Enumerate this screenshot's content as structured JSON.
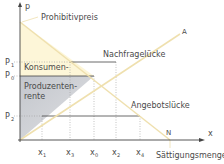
{
  "axes": {
    "y_label": "p",
    "x_label": "x"
  },
  "curves": {
    "supply_label": "A",
    "demand_label": "N"
  },
  "annotations": {
    "prohibitive_price": "Prohibitivpreis",
    "demand_gap": "Nachfragelücke",
    "supply_gap": "Angebotslücke",
    "saturation_quantity": "Sättigungsmenge",
    "consumer_surplus_line1": "Konsumen-",
    "consumer_surplus_line2": "tenrente",
    "producer_surplus_line1": "Produzenten-",
    "producer_surplus_line2": "rente"
  },
  "price_ticks": [
    {
      "main": "P",
      "sub": "1"
    },
    {
      "main": "P",
      "sub": "0"
    },
    {
      "main": "P",
      "sub": "2"
    }
  ],
  "quantity_ticks": [
    {
      "main": "x",
      "sub": "1"
    },
    {
      "main": "x",
      "sub": "3"
    },
    {
      "main": "x",
      "sub": "0"
    },
    {
      "main": "x",
      "sub": "2"
    },
    {
      "main": "x",
      "sub": "4"
    }
  ],
  "colors": {
    "consumer_surplus": "#fdf6d8",
    "producer_surplus": "#c9ccd2",
    "curve": "#f0e2b0",
    "axis": "#444444",
    "text": "#4a4a4a"
  }
}
